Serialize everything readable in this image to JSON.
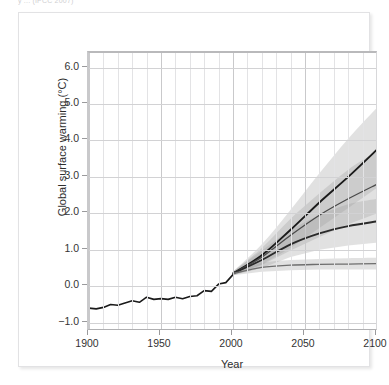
{
  "caption_fragment": "y ... (IPCC 2007)",
  "chart_data": {
    "type": "line",
    "title": "",
    "xlabel": "Year",
    "ylabel": "Global surface warming (°C)",
    "xlim": [
      1900,
      2100
    ],
    "ylim": [
      -1.2,
      6.4
    ],
    "xticks": [
      1900,
      1950,
      2000,
      2050,
      2100
    ],
    "xtick_labels": [
      "1900",
      "1950",
      "2000",
      "2050",
      "2100"
    ],
    "yticks": [
      -1.0,
      0.0,
      1.0,
      2.0,
      3.0,
      4.0,
      5.0,
      6.0
    ],
    "ytick_labels": [
      "−1.0",
      "0.0",
      "1.0",
      "2.0",
      "3.0",
      "4.0",
      "5.0",
      "6.0"
    ],
    "grid": true,
    "grid_minor_x_step": 10,
    "legend": "none",
    "series": [
      {
        "name": "observed-20th-century",
        "role": "historical",
        "color": "#1a1a1a",
        "x": [
          1900,
          1905,
          1910,
          1915,
          1920,
          1925,
          1930,
          1935,
          1940,
          1945,
          1950,
          1955,
          1960,
          1965,
          1970,
          1975,
          1980,
          1985,
          1990,
          1995,
          2000
        ],
        "values": [
          -0.6,
          -0.62,
          -0.58,
          -0.5,
          -0.52,
          -0.46,
          -0.4,
          -0.44,
          -0.3,
          -0.36,
          -0.34,
          -0.36,
          -0.3,
          -0.34,
          -0.28,
          -0.26,
          -0.12,
          -0.14,
          0.06,
          0.1,
          0.32
        ]
      },
      {
        "name": "scenario-high",
        "role": "projection",
        "color": "#1a1a1a",
        "x": [
          2000,
          2020,
          2040,
          2060,
          2080,
          2100
        ],
        "values": [
          0.35,
          0.85,
          1.55,
          2.3,
          3.0,
          3.75
        ],
        "band_low": [
          0.3,
          0.6,
          1.05,
          1.6,
          2.15,
          2.7
        ],
        "band_high": [
          0.4,
          1.15,
          2.1,
          3.1,
          4.05,
          4.9
        ]
      },
      {
        "name": "scenario-mid-high",
        "role": "projection",
        "color": "#4a4a4a",
        "x": [
          2000,
          2020,
          2040,
          2060,
          2080,
          2100
        ],
        "values": [
          0.35,
          0.8,
          1.4,
          1.95,
          2.4,
          2.8
        ],
        "band_low": [
          0.3,
          0.58,
          0.98,
          1.35,
          1.7,
          2.0
        ],
        "band_high": [
          0.4,
          1.05,
          1.85,
          2.55,
          3.2,
          3.7
        ]
      },
      {
        "name": "scenario-mid-low",
        "role": "projection",
        "color": "#2a2a2a",
        "x": [
          2000,
          2020,
          2040,
          2060,
          2080,
          2100
        ],
        "values": [
          0.35,
          0.72,
          1.15,
          1.45,
          1.65,
          1.78
        ],
        "band_low": [
          0.3,
          0.5,
          0.8,
          1.0,
          1.12,
          1.2
        ],
        "band_high": [
          0.4,
          0.98,
          1.55,
          1.95,
          2.25,
          2.4
        ]
      },
      {
        "name": "constant-composition-commitment",
        "role": "projection",
        "color": "#6e6e6e",
        "x": [
          2000,
          2020,
          2040,
          2060,
          2080,
          2100
        ],
        "values": [
          0.35,
          0.52,
          0.58,
          0.6,
          0.61,
          0.62
        ],
        "band_low": [
          0.3,
          0.4,
          0.44,
          0.46,
          0.46,
          0.46
        ],
        "band_high": [
          0.4,
          0.64,
          0.72,
          0.75,
          0.77,
          0.78
        ]
      }
    ]
  }
}
